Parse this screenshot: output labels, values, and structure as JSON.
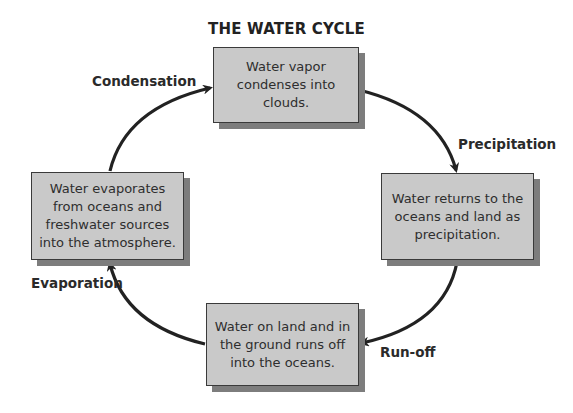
{
  "title": "THE WATER CYCLE",
  "colors": {
    "box_fill": "#c9c9c9",
    "box_border": "#3a3a3a",
    "box_shadow": "#7d7d7d",
    "arrow": "#222222",
    "text": "#2e2e2e"
  },
  "stages": {
    "condensation_box": {
      "lines": [
        "Water vapor",
        "condenses into",
        "clouds."
      ]
    },
    "precipitation_box": {
      "lines": [
        "Water returns to the",
        "oceans and land as",
        "precipitation."
      ]
    },
    "runoff_box": {
      "lines": [
        "Water on land and in",
        "the ground runs off",
        "into the oceans."
      ]
    },
    "evaporation_box": {
      "lines": [
        "Water evaporates",
        "from oceans and",
        "freshwater sources",
        "into the atmosphere."
      ]
    }
  },
  "labels": {
    "condensation": "Condensation",
    "precipitation": "Precipitation",
    "runoff": "Run-off",
    "evaporation": "Evaporation"
  }
}
